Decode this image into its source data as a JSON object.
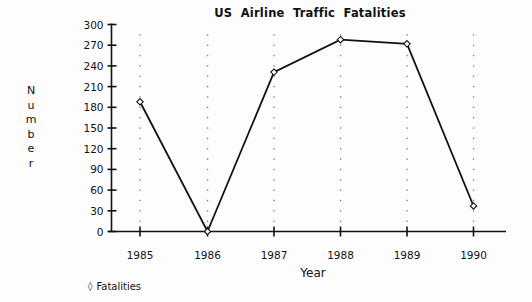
{
  "chart_data": {
    "type": "line",
    "title": "US  Airline  Traffic  Fatalities",
    "xlabel": "Year",
    "ylabel": "Number",
    "categories": [
      "1985",
      "1986",
      "1987",
      "1988",
      "1989",
      "1990"
    ],
    "series": [
      {
        "name": "Fatalities",
        "marker": "diamond",
        "values": [
          188,
          0,
          231,
          278,
          272,
          37
        ]
      }
    ],
    "ylim": [
      0,
      300
    ],
    "yticks": [
      0,
      30,
      60,
      90,
      120,
      150,
      180,
      210,
      240,
      270,
      300
    ],
    "ytick_labels": [
      "0",
      "30",
      "60",
      "90",
      "120",
      "150",
      "180",
      "210",
      "240",
      "270",
      "300"
    ],
    "xtick_labels": [
      "1985",
      "1986",
      "1987",
      "1988",
      "1989",
      "1990"
    ],
    "grid": "vertical-dotted",
    "legend": {
      "position": "bottom-left",
      "entries": [
        {
          "marker": "◊",
          "label": "Fatalities"
        }
      ]
    },
    "colors": {
      "background": "#fdfdfd",
      "line": "#111111",
      "axis": "#111111",
      "text": "#111111",
      "grid": "#8a8a8a"
    }
  },
  "ylabel_letters": [
    "N",
    "u",
    "m",
    "b",
    "e",
    "r"
  ]
}
